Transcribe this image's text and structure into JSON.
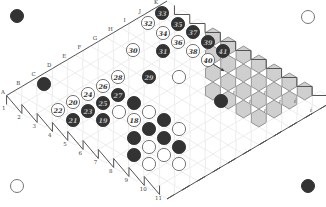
{
  "board": {
    "size": 11,
    "origin": [
      14,
      100
    ],
    "step_x": 15.3,
    "step_y": 9.0,
    "hex_radius": 8.6,
    "colors": {
      "cell_fill": "#ffffff",
      "cell_stroke": "#e4e4e4",
      "edge_stroke": "#555555",
      "shaded_fill": "#cfcfcf",
      "shaded_stroke": "#8a8a8a",
      "black": "#333333",
      "white_fill": "#ffffff",
      "white_stroke": "#666666"
    },
    "letters": [
      "A",
      "B",
      "C",
      "D",
      "E",
      "F",
      "G",
      "H",
      "I",
      "J",
      "K"
    ],
    "numbers": [
      "1",
      "2",
      "3",
      "4",
      "5",
      "6",
      "7",
      "8",
      "9",
      "10",
      "11"
    ]
  },
  "corner_stones": [
    {
      "name": "corner-black-top-left",
      "x": 17,
      "y": 16,
      "color": "black"
    },
    {
      "name": "corner-white-top-right",
      "x": 308,
      "y": 17,
      "color": "white"
    },
    {
      "name": "corner-white-bottom-left",
      "x": 17,
      "y": 186,
      "color": "white"
    },
    {
      "name": "corner-black-bottom-right",
      "x": 308,
      "y": 186,
      "color": "black"
    }
  ],
  "shaded_cells": [
    [
      10,
      3
    ],
    [
      10,
      4
    ],
    [
      10,
      5
    ],
    [
      10,
      6
    ],
    [
      10,
      7
    ],
    [
      10,
      8
    ],
    [
      10,
      9
    ],
    [
      9,
      4
    ],
    [
      9,
      5
    ],
    [
      9,
      6
    ],
    [
      9,
      7
    ],
    [
      9,
      8
    ],
    [
      9,
      9
    ],
    [
      8,
      5
    ],
    [
      8,
      6
    ],
    [
      8,
      7
    ],
    [
      8,
      8
    ],
    [
      8,
      9
    ],
    [
      7,
      6
    ],
    [
      7,
      7
    ],
    [
      7,
      8
    ],
    [
      7,
      9
    ]
  ],
  "marked_cells": [
    {
      "x": 234,
      "y": 92,
      "mark": "i"
    },
    {
      "x": 265,
      "y": 92,
      "mark": "i"
    },
    {
      "x": 250,
      "y": 101,
      "mark": "i"
    },
    {
      "x": 280,
      "y": 101,
      "mark": "i"
    },
    {
      "x": 265,
      "y": 110,
      "mark": "i"
    },
    {
      "x": 295,
      "y": 101,
      "mark": "i"
    },
    {
      "x": 311,
      "y": 110,
      "mark": "i"
    }
  ],
  "stones": [
    {
      "x": 162,
      "y": 13,
      "color": "black",
      "label": "33"
    },
    {
      "x": 148,
      "y": 23,
      "color": "white",
      "label": "32"
    },
    {
      "x": 178,
      "y": 24,
      "color": "black",
      "label": "35"
    },
    {
      "x": 163,
      "y": 33,
      "color": "white",
      "label": "34"
    },
    {
      "x": 193,
      "y": 32,
      "color": "black",
      "label": "37"
    },
    {
      "x": 178,
      "y": 42,
      "color": "white",
      "label": "36"
    },
    {
      "x": 208,
      "y": 42,
      "color": "black",
      "label": "39"
    },
    {
      "x": 163,
      "y": 51,
      "color": "black",
      "label": "31"
    },
    {
      "x": 193,
      "y": 51,
      "color": "white",
      "label": "38"
    },
    {
      "x": 223,
      "y": 51,
      "color": "black",
      "label": "41"
    },
    {
      "x": 133,
      "y": 50,
      "color": "white",
      "label": "30"
    },
    {
      "x": 208,
      "y": 60,
      "color": "white",
      "label": "40"
    },
    {
      "x": 149,
      "y": 77,
      "color": "black",
      "label": "29"
    },
    {
      "x": 179,
      "y": 77,
      "color": "white",
      "label": ""
    },
    {
      "x": 118,
      "y": 77,
      "color": "white",
      "label": "28"
    },
    {
      "x": 103,
      "y": 86,
      "color": "white",
      "label": "26"
    },
    {
      "x": 118,
      "y": 95,
      "color": "black",
      "label": "27"
    },
    {
      "x": 88,
      "y": 94,
      "color": "white",
      "label": "24"
    },
    {
      "x": 103,
      "y": 103,
      "color": "black",
      "label": "25"
    },
    {
      "x": 134,
      "y": 103,
      "color": "black",
      "label": ""
    },
    {
      "x": 73,
      "y": 102,
      "color": "white",
      "label": "20"
    },
    {
      "x": 88,
      "y": 111,
      "color": "black",
      "label": "23"
    },
    {
      "x": 119,
      "y": 112,
      "color": "white",
      "label": ""
    },
    {
      "x": 58,
      "y": 110,
      "color": "white",
      "label": "22"
    },
    {
      "x": 73,
      "y": 120,
      "color": "black",
      "label": "21"
    },
    {
      "x": 103,
      "y": 120,
      "color": "black",
      "label": "19"
    },
    {
      "x": 149,
      "y": 112,
      "color": "white",
      "label": ""
    },
    {
      "x": 134,
      "y": 120,
      "color": "white",
      "label": "18"
    },
    {
      "x": 164,
      "y": 120,
      "color": "black",
      "label": ""
    },
    {
      "x": 149,
      "y": 129,
      "color": "black",
      "label": ""
    },
    {
      "x": 179,
      "y": 129,
      "color": "white",
      "label": ""
    },
    {
      "x": 134,
      "y": 138,
      "color": "black",
      "label": ""
    },
    {
      "x": 164,
      "y": 138,
      "color": "black",
      "label": ""
    },
    {
      "x": 149,
      "y": 147,
      "color": "white",
      "label": ""
    },
    {
      "x": 179,
      "y": 147,
      "color": "black",
      "label": ""
    },
    {
      "x": 134,
      "y": 155,
      "color": "black",
      "label": ""
    },
    {
      "x": 164,
      "y": 155,
      "color": "white",
      "label": ""
    },
    {
      "x": 149,
      "y": 164,
      "color": "white",
      "label": ""
    },
    {
      "x": 179,
      "y": 164,
      "color": "white",
      "label": ""
    },
    {
      "x": 44,
      "y": 84,
      "color": "black",
      "label": ""
    },
    {
      "x": 221,
      "y": 101,
      "color": "black",
      "label": ""
    }
  ],
  "arrow": {
    "from": [
      213,
      64
    ],
    "to": [
      224,
      71
    ]
  }
}
